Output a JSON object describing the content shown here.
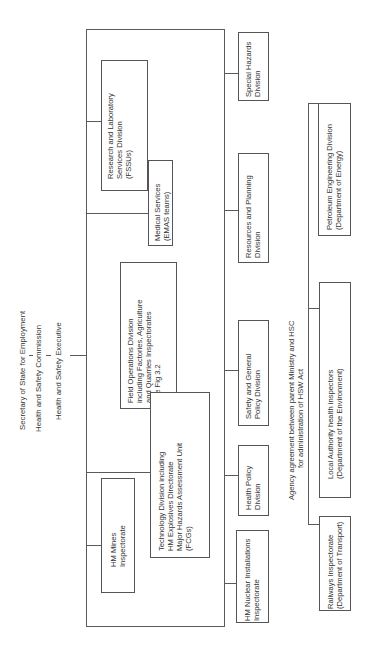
{
  "header": {
    "line1": "Secretary of State for Employment",
    "line2": "Health and Safety Commission",
    "line3": "Health and Safety Executive",
    "sep": "|"
  },
  "left_branch": {
    "research": {
      "l1": "Research and Laboratory",
      "l2": "Services Division",
      "l3": "(FSSUs)"
    },
    "medical": {
      "l1": "Medical Services",
      "l2": "(EMAS teams)"
    },
    "field_ops": {
      "l1": "Field Operations Division",
      "l2": "including Factories, Agriculture",
      "l3": "and Quarries Inspectorates",
      "l4": "See Fig 3.2"
    },
    "technology": {
      "l1": "Technology Division including",
      "l2": "HM Explosives Directorate",
      "l3": "Major Hazards Assessment Unit",
      "l4": "(FCGs)"
    },
    "mines": {
      "l1": "HM Mines",
      "l2": "Inspectorate"
    }
  },
  "right_branch": {
    "special": {
      "l1": "Special Hazards",
      "l2": "Division"
    },
    "resources": {
      "l1": "Resources and Planning",
      "l2": "Division"
    },
    "safety": {
      "l1": "Safety and General",
      "l2": "Policy Division"
    },
    "health": {
      "l1": "Health Policy",
      "l2": "Division"
    },
    "nuclear": {
      "l1": "HM Nuclear Installations",
      "l2": "Inspectorate"
    }
  },
  "agency": {
    "note_l1": "Agency agreement between parent Ministry and HSC",
    "note_l2": "for administration of HSW Act",
    "petroleum": {
      "l1": "Petroleum Engineering Division",
      "l2": "(Department of Energy)"
    },
    "local": {
      "l1": "Local Authority health inspectors",
      "l2": "(Department of the Environment)"
    },
    "railways": {
      "l1": "Railways Inspectorate",
      "l2": "(Department of Transport)"
    }
  }
}
